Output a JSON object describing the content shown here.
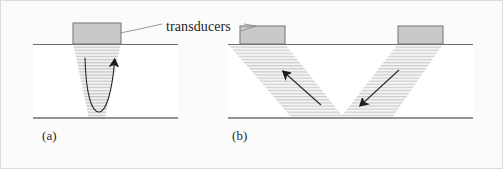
{
  "figure": {
    "background_color": "#fbfbfb",
    "canvas": {
      "width": 503,
      "height": 169
    },
    "border_color": "#d8d8d8",
    "annotation": {
      "label": "transducers",
      "leader_color": "#8a8a8a"
    },
    "panels": [
      {
        "id": "a",
        "caption": "(a)",
        "configuration": "pulse-echo single transducer",
        "specimen": {
          "fill": "#ffffff",
          "top_surface_color": "#6f6f6f",
          "bottom_surface_color": "#6f6f6f",
          "x": 33,
          "y": 44,
          "width": 145,
          "height": 74
        },
        "transducers": [
          {
            "name": "transducer-a1",
            "x": 73,
            "y": 23,
            "width": 48,
            "height": 21,
            "fill": "#c9c9c9",
            "stroke": "#7d7d7d"
          }
        ],
        "beam": {
          "shape": "converging-wedge",
          "hatch_color": "#bdbdbd",
          "fill": "#ededed",
          "top_width": 48,
          "bottom_width": 16,
          "depth": 74
        },
        "ray_path": {
          "shape": "u-curve",
          "direction": "down-and-up",
          "arrow_direction": "up-right",
          "stroke": "#2a2a2a"
        }
      },
      {
        "id": "b",
        "caption": "(b)",
        "configuration": "pitch-catch two transducers",
        "specimen": {
          "fill": "#ffffff",
          "top_surface_color": "#6f6f6f",
          "bottom_surface_color": "#6f6f6f",
          "x": 228,
          "y": 44,
          "width": 245,
          "height": 74
        },
        "transducers": [
          {
            "name": "transducer-b1",
            "x": 240,
            "y": 26,
            "width": 45,
            "height": 18,
            "fill": "#c9c9c9",
            "stroke": "#7d7d7d"
          },
          {
            "name": "transducer-b2",
            "x": 398,
            "y": 26,
            "width": 45,
            "height": 18,
            "fill": "#c9c9c9",
            "stroke": "#7d7d7d"
          }
        ],
        "beam": {
          "shape": "v-path",
          "hatch_color": "#bdbdbd",
          "fill": "#ededed",
          "left_leg_angle_deg": 38,
          "right_leg_angle_deg": -38
        },
        "ray_paths": [
          {
            "name": "ray-left",
            "arrow_direction": "up-left",
            "stroke": "#2a2a2a"
          },
          {
            "name": "ray-right",
            "arrow_direction": "down-left",
            "stroke": "#2a2a2a"
          }
        ]
      }
    ]
  }
}
